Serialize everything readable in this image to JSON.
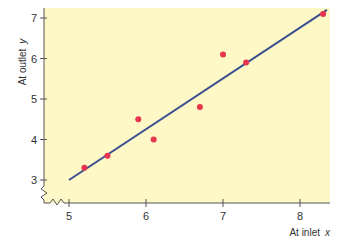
{
  "chart_data": {
    "type": "scatter",
    "title": "",
    "xlabel": "At inlet",
    "xlabel_var": "x",
    "ylabel": "At outlet",
    "ylabel_var": "y",
    "xlim": [
      4.5,
      8.4
    ],
    "ylim": [
      2.6,
      7.2
    ],
    "x_ticks": [
      5,
      6,
      7,
      8
    ],
    "y_ticks": [
      3,
      4,
      5,
      6,
      7
    ],
    "grid": false,
    "axis_breaks": true,
    "series": [
      {
        "name": "observations",
        "type": "scatter",
        "color": "#e8344e",
        "points": [
          {
            "x": 5.2,
            "y": 3.3
          },
          {
            "x": 5.5,
            "y": 3.6
          },
          {
            "x": 5.9,
            "y": 4.5
          },
          {
            "x": 6.1,
            "y": 4.0
          },
          {
            "x": 6.7,
            "y": 4.8
          },
          {
            "x": 7.0,
            "y": 6.1
          },
          {
            "x": 7.3,
            "y": 5.9
          },
          {
            "x": 8.3,
            "y": 7.1
          }
        ]
      },
      {
        "name": "fitted line",
        "type": "line",
        "color": "#3a4f8f",
        "points": [
          {
            "x": 5.0,
            "y": 3.0
          },
          {
            "x": 8.35,
            "y": 7.2
          }
        ]
      }
    ],
    "background_color": "#fdf8c6"
  }
}
